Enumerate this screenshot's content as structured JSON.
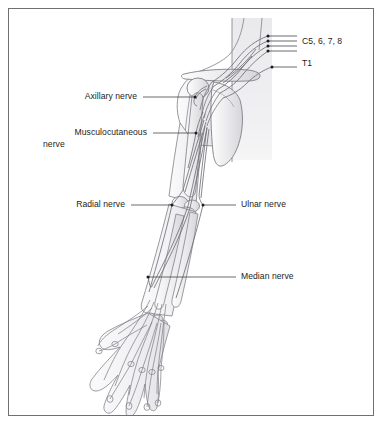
{
  "figure": {
    "border_color": "#6f6f74",
    "background_color": "#ffffff",
    "ink_color": "#1d1d20",
    "leader_color": "#3a3a3e",
    "anatomy_line_color": "#8d8d93",
    "anatomy_fill_color": "#e9e9eb",
    "torso_shade_color": "#ededef",
    "width": 384,
    "height": 426
  },
  "labels": {
    "nerve_roots": {
      "text": "C5, 6, 7, 8",
      "x": 302,
      "y": 42
    },
    "t1_root": {
      "text": "T1",
      "x": 302,
      "y": 63
    },
    "axillary": {
      "text": "Axillary nerve",
      "x": 137,
      "y": 95
    },
    "musculocutaneous_line1": {
      "text": "Musculocutaneous",
      "x": 147,
      "y": 131
    },
    "musculocutaneous_line2": {
      "text": "nerve",
      "x": 71,
      "y": 143
    },
    "radial": {
      "text": "Radial nerve",
      "x": 125,
      "y": 202
    },
    "ulnar": {
      "text": "Ulnar nerve",
      "x": 241,
      "y": 202
    },
    "median": {
      "text": "Median nerve",
      "x": 241,
      "y": 273
    }
  },
  "leaders": {
    "c5_rows": [
      {
        "dot_x": 268,
        "dot_y": 36,
        "end_x": 297
      },
      {
        "dot_x": 268,
        "dot_y": 41,
        "end_x": 297
      },
      {
        "dot_x": 268,
        "dot_y": 46,
        "end_x": 297
      },
      {
        "dot_x": 268,
        "dot_y": 51,
        "end_x": 297
      }
    ],
    "t1": {
      "dot_x": 272,
      "dot_y": 67,
      "end_x": 297
    },
    "axillary": {
      "dot_x": 195,
      "dot_y": 97,
      "end_x": 143
    },
    "musculocutaneous": {
      "dot_x": 196,
      "dot_y": 133,
      "end_x": 153
    },
    "radial": {
      "dot_x": 172,
      "dot_y": 205,
      "end_x": 131
    },
    "ulnar": {
      "dot_x": 203,
      "dot_y": 205,
      "end_x": 236
    },
    "median": {
      "dot_x": 148,
      "dot_y": 277,
      "end_x": 236
    }
  },
  "anatomy": {
    "parts": [
      "neck-outline",
      "shoulder-outline",
      "clavicle",
      "scapula",
      "humerus",
      "radius",
      "ulna",
      "carpal-bones",
      "metacarpal-bones",
      "phalanges",
      "brachial-plexus-trunks",
      "axillary-nerve-branch",
      "musculocutaneous-nerve-branch",
      "radial-nerve-branch",
      "ulnar-nerve-branch",
      "median-nerve-branch",
      "digital-nerve-branches"
    ]
  }
}
